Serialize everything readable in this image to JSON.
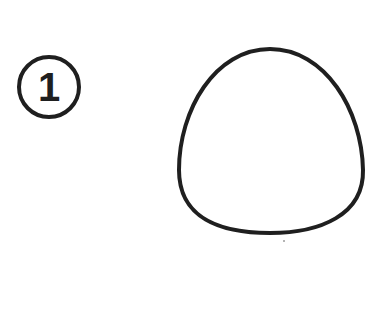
{
  "step": {
    "number": "1"
  },
  "colors": {
    "stroke": "#1f1f1f",
    "background": "#ffffff"
  }
}
